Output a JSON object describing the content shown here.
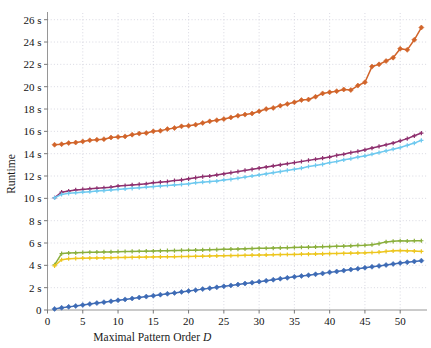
{
  "chart_data": {
    "type": "line",
    "title": "",
    "xlabel": "Maximal Pattern Order D",
    "xlabel_plain": "Maximal Pattern Order",
    "xlabel_italic": "D",
    "ylabel": "Runtime",
    "xlim": [
      0,
      53.8
    ],
    "ylim": [
      0,
      26.6
    ],
    "grid": true,
    "legend": "none",
    "xticks": [
      0,
      5,
      10,
      15,
      20,
      25,
      30,
      35,
      40,
      45,
      50
    ],
    "xticklabels": [
      "0",
      "5",
      "10",
      "15",
      "20",
      "25",
      "30",
      "35",
      "40",
      "45",
      "50"
    ],
    "yticks": [
      0,
      2,
      4,
      6,
      8,
      10,
      12,
      14,
      16,
      18,
      20,
      22,
      24,
      26
    ],
    "yticklabels": [
      "0",
      "2 s",
      "4 s",
      "6 s",
      "8 s",
      "10 s",
      "12 s",
      "14 s",
      "16 s",
      "18 s",
      "20 s",
      "22 s",
      "24 s",
      "26 s"
    ],
    "x": [
      1,
      2,
      3,
      4,
      5,
      6,
      7,
      8,
      9,
      10,
      11,
      12,
      13,
      14,
      15,
      16,
      17,
      18,
      19,
      20,
      21,
      22,
      23,
      24,
      25,
      26,
      27,
      28,
      29,
      30,
      31,
      32,
      33,
      34,
      35,
      36,
      37,
      38,
      39,
      40,
      41,
      42,
      43,
      44,
      45,
      46,
      47,
      48,
      49,
      50,
      51,
      52,
      53
    ],
    "series": [
      {
        "name": "orange-series",
        "color": "#d1642a",
        "marker": "diamond",
        "values": [
          14.8,
          14.85,
          14.95,
          15.0,
          15.1,
          15.2,
          15.25,
          15.3,
          15.45,
          15.5,
          15.55,
          15.7,
          15.8,
          15.85,
          16.0,
          16.05,
          16.2,
          16.3,
          16.45,
          16.5,
          16.6,
          16.75,
          16.9,
          17.0,
          17.1,
          17.25,
          17.4,
          17.5,
          17.6,
          17.8,
          18.0,
          18.1,
          18.3,
          18.45,
          18.6,
          18.8,
          18.85,
          19.1,
          19.4,
          19.5,
          19.6,
          19.75,
          19.7,
          20.1,
          20.4,
          21.8,
          22.0,
          22.3,
          22.6,
          23.4,
          23.3,
          24.2,
          25.3
        ]
      },
      {
        "name": "purple-series",
        "color": "#8e2f6e",
        "marker": "plus",
        "values": [
          10.05,
          10.55,
          10.65,
          10.75,
          10.8,
          10.85,
          10.9,
          10.95,
          11.0,
          11.1,
          11.15,
          11.2,
          11.25,
          11.3,
          11.4,
          11.45,
          11.5,
          11.6,
          11.65,
          11.75,
          11.85,
          11.95,
          12.0,
          12.1,
          12.2,
          12.3,
          12.4,
          12.5,
          12.6,
          12.7,
          12.8,
          12.9,
          13.0,
          13.1,
          13.2,
          13.3,
          13.4,
          13.5,
          13.6,
          13.7,
          13.85,
          13.95,
          14.1,
          14.2,
          14.35,
          14.5,
          14.65,
          14.8,
          14.95,
          15.15,
          15.35,
          15.6,
          15.85
        ]
      },
      {
        "name": "cyan-series",
        "color": "#6ec9ef",
        "marker": "plus",
        "values": [
          10.05,
          10.35,
          10.45,
          10.5,
          10.55,
          10.6,
          10.65,
          10.7,
          10.75,
          10.8,
          10.85,
          10.9,
          10.95,
          11.0,
          11.05,
          11.1,
          11.15,
          11.2,
          11.25,
          11.3,
          11.4,
          11.45,
          11.5,
          11.55,
          11.65,
          11.7,
          11.8,
          11.9,
          12.0,
          12.1,
          12.2,
          12.3,
          12.4,
          12.5,
          12.6,
          12.7,
          12.85,
          12.95,
          13.05,
          13.2,
          13.3,
          13.45,
          13.55,
          13.7,
          13.8,
          13.95,
          14.1,
          14.25,
          14.4,
          14.55,
          14.75,
          14.95,
          15.2
        ]
      },
      {
        "name": "green-series",
        "color": "#8aaf3c",
        "marker": "plus",
        "values": [
          4.05,
          5.05,
          5.1,
          5.12,
          5.15,
          5.17,
          5.18,
          5.2,
          5.2,
          5.22,
          5.24,
          5.25,
          5.26,
          5.27,
          5.28,
          5.3,
          5.31,
          5.32,
          5.34,
          5.35,
          5.36,
          5.38,
          5.4,
          5.41,
          5.43,
          5.45,
          5.46,
          5.48,
          5.5,
          5.52,
          5.53,
          5.55,
          5.57,
          5.58,
          5.6,
          5.62,
          5.63,
          5.65,
          5.67,
          5.68,
          5.7,
          5.72,
          5.75,
          5.78,
          5.8,
          5.85,
          5.95,
          6.1,
          6.15,
          6.2,
          6.18,
          6.2,
          6.2
        ]
      },
      {
        "name": "yellow-series",
        "color": "#edc61e",
        "marker": "plus",
        "values": [
          3.95,
          4.5,
          4.6,
          4.62,
          4.64,
          4.65,
          4.66,
          4.67,
          4.68,
          4.7,
          4.71,
          4.72,
          4.73,
          4.74,
          4.75,
          4.76,
          4.77,
          4.78,
          4.79,
          4.8,
          4.81,
          4.82,
          4.84,
          4.85,
          4.86,
          4.87,
          4.88,
          4.9,
          4.91,
          4.92,
          4.93,
          4.95,
          4.96,
          4.97,
          4.98,
          5.0,
          5.01,
          5.02,
          5.03,
          5.05,
          5.06,
          5.08,
          5.09,
          5.11,
          5.12,
          5.15,
          5.18,
          5.25,
          5.3,
          5.32,
          5.3,
          5.28,
          5.25
        ]
      },
      {
        "name": "blue-series",
        "color": "#3e6bb5",
        "marker": "diamond",
        "values": [
          0.1,
          0.2,
          0.28,
          0.36,
          0.45,
          0.53,
          0.62,
          0.7,
          0.78,
          0.87,
          0.95,
          1.03,
          1.12,
          1.2,
          1.28,
          1.37,
          1.45,
          1.53,
          1.62,
          1.7,
          1.78,
          1.87,
          1.95,
          2.03,
          2.12,
          2.2,
          2.28,
          2.37,
          2.45,
          2.54,
          2.62,
          2.71,
          2.8,
          2.88,
          2.97,
          3.05,
          3.12,
          3.2,
          3.28,
          3.37,
          3.45,
          3.53,
          3.62,
          3.7,
          3.78,
          3.87,
          3.95,
          4.03,
          4.12,
          4.2,
          4.28,
          4.35,
          4.42
        ]
      }
    ]
  }
}
